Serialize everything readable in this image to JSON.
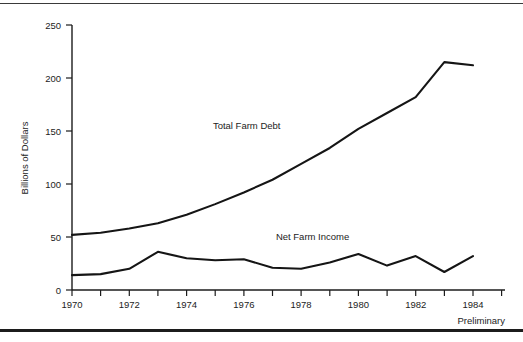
{
  "chart_data": {
    "type": "line",
    "title": "",
    "xlabel": "",
    "ylabel": "Billions of Dollars",
    "xlim": [
      1970,
      1985
    ],
    "ylim": [
      0,
      250
    ],
    "grid": false,
    "legend_position": "inline-annotation",
    "x": [
      1970,
      1971,
      1972,
      1973,
      1974,
      1975,
      1976,
      1977,
      1978,
      1979,
      1980,
      1981,
      1982,
      1983,
      1984
    ],
    "xtick_values": [
      1970,
      1971,
      1972,
      1973,
      1974,
      1975,
      1976,
      1977,
      1978,
      1979,
      1980,
      1981,
      1982,
      1983,
      1984,
      1985
    ],
    "xtick_labels": [
      "1970",
      "",
      "1972",
      "",
      "1974",
      "",
      "1976",
      "",
      "1978",
      "",
      "1980",
      "",
      "1982",
      "",
      "1984",
      ""
    ],
    "ytick_values": [
      0,
      50,
      100,
      150,
      200,
      250
    ],
    "ytick_labels": [
      "0",
      "50",
      "100",
      "150",
      "200",
      "250"
    ],
    "series": [
      {
        "name": "Total Farm Debt",
        "label_x": 1976.1,
        "label_y": 152,
        "values": [
          52,
          54,
          58,
          63,
          71,
          81,
          92,
          104,
          119,
          134,
          152,
          167,
          182,
          215,
          212
        ]
      },
      {
        "name": "Net Farm Income",
        "label_x": 1978.4,
        "label_y": 47,
        "values": [
          14,
          15,
          20,
          36,
          30,
          28,
          29,
          21,
          20,
          26,
          34,
          23,
          32,
          17,
          32
        ]
      }
    ],
    "annotations": [
      {
        "text": "Preliminary",
        "position": "bottom-right"
      }
    ]
  }
}
